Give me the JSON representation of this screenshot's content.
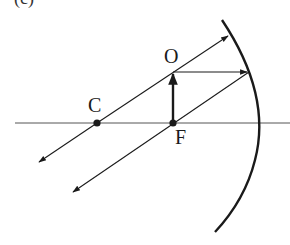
{
  "diagram": {
    "panel_label": "(c)",
    "type": "concave mirror ray diagram",
    "labels": {
      "center_of_curvature": "C",
      "focal_point": "F",
      "object": "O"
    },
    "colors": {
      "ink": "#1a1a1a",
      "axis": "#555555",
      "background": "#ffffff"
    },
    "elements": [
      "principal axis",
      "concave mirror (arc)",
      "object arrow at F",
      "ray through C reflecting back on itself",
      "ray parallel to axis reflecting through F",
      "reflected rays parallel (image at infinity)"
    ]
  }
}
